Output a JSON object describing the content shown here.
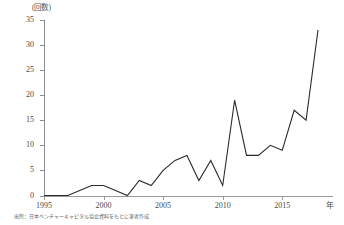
{
  "chart_data": {
    "type": "line",
    "title": "",
    "subtitle": "",
    "xlabel": "年",
    "ylabel": "(回数)",
    "yunit_label": "(回数)",
    "xunit_label": "年",
    "xlim": [
      1995,
      2018
    ],
    "ylim": [
      0,
      35
    ],
    "ytick_values": [
      0,
      5,
      10,
      15,
      20,
      25,
      30,
      35
    ],
    "ytick_labels": [
      "0",
      "5",
      "10",
      "15",
      "20",
      "25",
      "30",
      "35"
    ],
    "xtick_values": [
      1995,
      2000,
      2005,
      2010,
      2015
    ],
    "xtick_labels": [
      "1995",
      "2000",
      "2005",
      "2010",
      "2015"
    ],
    "grid": false,
    "legend": false,
    "legend_position": "none",
    "line_color": "#2a2a2a",
    "x": [
      1995,
      1996,
      1997,
      1998,
      1999,
      2000,
      2001,
      2002,
      2003,
      2004,
      2005,
      2006,
      2007,
      2008,
      2009,
      2010,
      2011,
      2012,
      2013,
      2014,
      2015,
      2016,
      2017,
      2018
    ],
    "values": [
      0,
      0,
      0,
      1,
      2,
      2,
      1,
      0,
      3,
      2,
      5,
      7,
      8,
      3,
      7,
      2,
      19,
      8,
      8,
      10,
      9,
      17,
      15,
      33
    ],
    "series": [
      {
        "name": "回数",
        "values": [
          0,
          0,
          0,
          1,
          2,
          2,
          1,
          0,
          3,
          2,
          5,
          7,
          8,
          3,
          7,
          2,
          19,
          8,
          8,
          10,
          9,
          17,
          15,
          33
        ]
      }
    ]
  },
  "source_note": "出所：日本ベンチャーキャピタル協会資料をもとに筆者作成",
  "colors": {
    "line": "#2a2a2a",
    "axis": "#9a9a9a",
    "text": "#4a4a4a",
    "background": "#ffffff"
  }
}
